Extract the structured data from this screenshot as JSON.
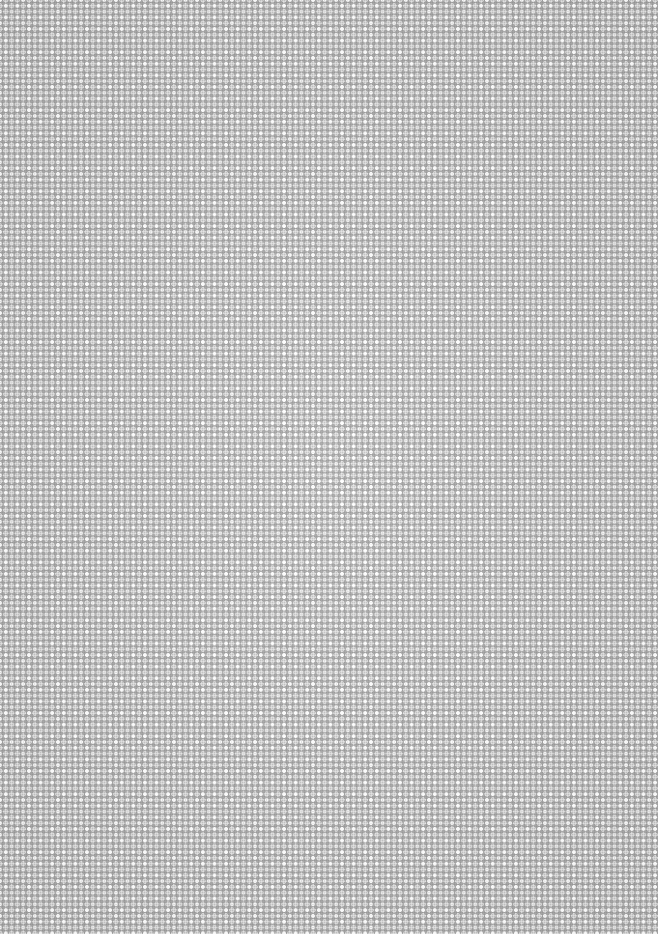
{
  "canvas": {
    "width": 658,
    "height": 934,
    "description": "Seamless gray diamond lattice texture with white dots"
  },
  "pattern": {
    "type": "diamond-checker-lattice",
    "period_px": 11.6,
    "colors": {
      "base": "#c4c4c4",
      "dots": "#ffffff",
      "diamonds": "#787878",
      "fine_grid": "#e0e0e0"
    }
  }
}
